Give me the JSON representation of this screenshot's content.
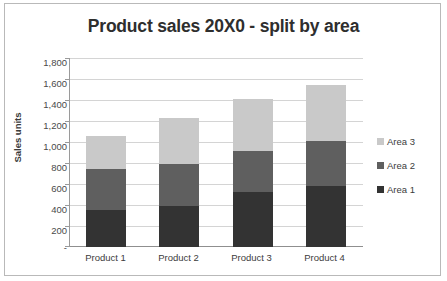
{
  "chart_data": {
    "type": "bar",
    "subtype": "stacked-bar",
    "title": "Product sales 20X0 - split by area",
    "xlabel": "",
    "ylabel": "Sales units",
    "categories": [
      "Product 1",
      "Product 2",
      "Product 3",
      "Product 4"
    ],
    "series": [
      {
        "name": "Area 1",
        "color": "#333333",
        "values": [
          350,
          390,
          520,
          580
        ]
      },
      {
        "name": "Area 2",
        "color": "#5f5f5f",
        "values": [
          390,
          400,
          390,
          430
        ]
      },
      {
        "name": "Area 3",
        "color": "#c9c9c9",
        "values": [
          320,
          440,
          500,
          535
        ]
      }
    ],
    "totals": [
      1060,
      1230,
      1410,
      1545
    ],
    "ylim": [
      0,
      1800
    ],
    "ytick_step": 200,
    "ytick_labels": [
      "1,800",
      "1,600",
      "1,400",
      "1,200",
      "1,000",
      "800",
      "600",
      "400",
      "200",
      "-"
    ],
    "ytick_values": [
      1800,
      1600,
      1400,
      1200,
      1000,
      800,
      600,
      400,
      200,
      0
    ],
    "grid": true,
    "legend_position": "right",
    "legend_entries": [
      "Area 3",
      "Area 2",
      "Area 1"
    ],
    "stack_order_bottom_to_top": [
      "Area 1",
      "Area 2",
      "Area 3"
    ],
    "colors": {
      "area1": "#333333",
      "area2": "#5f5f5f",
      "area3": "#c9c9c9",
      "gridline": "#d4d4d4",
      "axis": "#9a9a9a",
      "border": "#b9b9b9",
      "background": "#ffffff",
      "title_text": "#2e2e2e",
      "label_text": "#4a4a4a"
    }
  },
  "axis": {
    "y_title": "Sales units"
  },
  "ytick_labels": {
    "t0": "1,800",
    "t1": "1,600",
    "t2": "1,400",
    "t3": "1,200",
    "t4": "1,000",
    "t5": "800",
    "t6": "600",
    "t7": "400",
    "t8": "200",
    "t9": "-"
  },
  "xtick_labels": {
    "c0": "Product 1",
    "c1": "Product 2",
    "c2": "Product 3",
    "c3": "Product 4"
  },
  "legend": {
    "row0": "Area 3",
    "row1": "Area 2",
    "row2": "Area 1"
  }
}
